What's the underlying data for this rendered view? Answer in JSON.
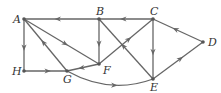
{
  "diagram": {
    "type": "directed-graph",
    "nodes": [
      {
        "id": "A",
        "label": "A",
        "x": 24,
        "y": 19
      },
      {
        "id": "B",
        "label": "B",
        "x": 99,
        "y": 19
      },
      {
        "id": "C",
        "label": "C",
        "x": 153,
        "y": 19
      },
      {
        "id": "D",
        "label": "D",
        "x": 203,
        "y": 42
      },
      {
        "id": "E",
        "label": "E",
        "x": 153,
        "y": 79
      },
      {
        "id": "F",
        "label": "F",
        "x": 99,
        "y": 64
      },
      {
        "id": "G",
        "label": "G",
        "x": 67,
        "y": 71
      },
      {
        "id": "H",
        "label": "H",
        "x": 24,
        "y": 71
      }
    ],
    "edges": [
      {
        "from": "C",
        "to": "B"
      },
      {
        "from": "B",
        "to": "A"
      },
      {
        "from": "A",
        "to": "H"
      },
      {
        "from": "H",
        "to": "G"
      },
      {
        "from": "G",
        "to": "A"
      },
      {
        "from": "A",
        "to": "F"
      },
      {
        "from": "B",
        "to": "F"
      },
      {
        "from": "F",
        "to": "G"
      },
      {
        "from": "F",
        "to": "C"
      },
      {
        "from": "E",
        "to": "B"
      },
      {
        "from": "C",
        "to": "E"
      },
      {
        "from": "D",
        "to": "C"
      },
      {
        "from": "E",
        "to": "D"
      },
      {
        "from": "G",
        "to": "E",
        "curved": true
      }
    ]
  }
}
